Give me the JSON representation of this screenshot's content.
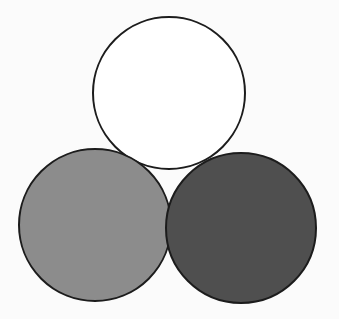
{
  "canvas": {
    "width": 339,
    "height": 319,
    "background": "#fbfbfb"
  },
  "diagram": {
    "type": "three-circles",
    "stroke_color": "#1c1c1c",
    "stroke_width": 2,
    "circles": [
      {
        "name": "top-circle",
        "cx": 169,
        "cy": 93,
        "r": 76,
        "fill": "#ffffff"
      },
      {
        "name": "bottom-left-circle",
        "cx": 95,
        "cy": 225,
        "r": 76,
        "fill": "#8c8c8c"
      },
      {
        "name": "bottom-right-circle",
        "cx": 241,
        "cy": 228,
        "r": 75,
        "fill": "#4f4f4f"
      }
    ]
  }
}
